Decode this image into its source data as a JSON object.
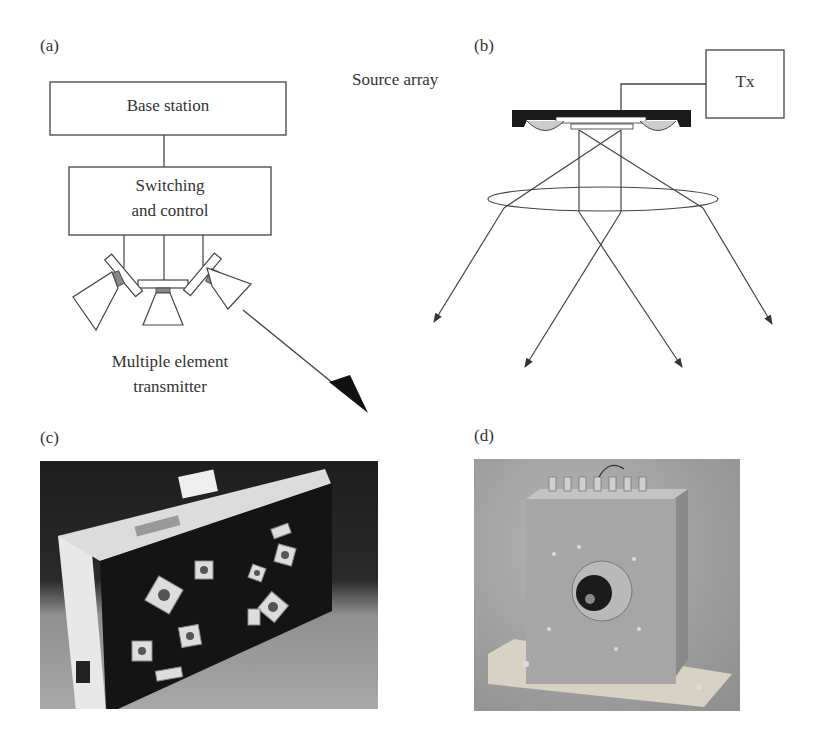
{
  "figure": {
    "panels": {
      "a": {
        "label": "(a)",
        "boxes": {
          "base_station": "Base station",
          "switching_line1": "Switching",
          "switching_line2": "and control"
        },
        "caption_line1": "Multiple element",
        "caption_line2": "transmitter"
      },
      "b": {
        "label": "(b)",
        "source_array_label": "Source array",
        "tx_box": "Tx",
        "beam_count": 4
      },
      "c": {
        "label": "(c)",
        "photo_description": "Photograph of multi-element transmitter box with angled square transducer elements"
      },
      "d": {
        "label": "(d)",
        "photo_description": "Photograph of metal transmitter housing with central lens on wooden base"
      }
    },
    "colors": {
      "line": "#333333",
      "fill_dark": "#1a1a1a",
      "fill_grey": "#999999"
    }
  }
}
